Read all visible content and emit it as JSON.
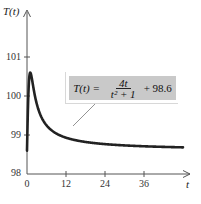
{
  "chart_data": {
    "type": "line",
    "title": "",
    "xlabel": "t",
    "ylabel": "T(t)",
    "xlim": [
      0,
      50
    ],
    "ylim": [
      98,
      101.5
    ],
    "x_ticks": [
      0,
      12,
      24,
      36
    ],
    "y_ticks": [
      98,
      99,
      100,
      101
    ],
    "grid": false,
    "legend": null,
    "annotation": {
      "text": "T(t) = 4t/(t^2 + 1) + 98.6",
      "lhs": "T(t) =",
      "numerator": "4t",
      "denominator": "t² + 1",
      "rhs": "+ 98.6"
    },
    "function": "T(t) = 4t/(t^2+1) + 98.6",
    "series": [
      {
        "name": "T(t)",
        "x": [
          0,
          0.25,
          0.5,
          0.75,
          1,
          1.5,
          2,
          3,
          4,
          5,
          6,
          8,
          10,
          12,
          15,
          18,
          21,
          24,
          30,
          36,
          42,
          48
        ],
        "values": [
          98.6,
          99.54,
          100.2,
          100.52,
          100.6,
          100.45,
          100.2,
          99.8,
          99.54,
          99.37,
          99.25,
          99.09,
          99.0,
          98.93,
          98.87,
          98.82,
          98.79,
          98.77,
          98.73,
          98.71,
          98.7,
          98.68
        ]
      }
    ]
  },
  "axes": {
    "y_title": "T(t)",
    "x_title": "t",
    "x_tick_labels": [
      "0",
      "12",
      "24",
      "36"
    ],
    "y_tick_labels": [
      "98",
      "99",
      "100",
      "101"
    ]
  },
  "formula": {
    "lhs": "T(t) =",
    "numerator": "4t",
    "denominator": "t² + 1",
    "rhs": "+ 98.6"
  },
  "colors": {
    "curve": "#222222",
    "axis": "#555555",
    "box": "#c9c9c9"
  }
}
